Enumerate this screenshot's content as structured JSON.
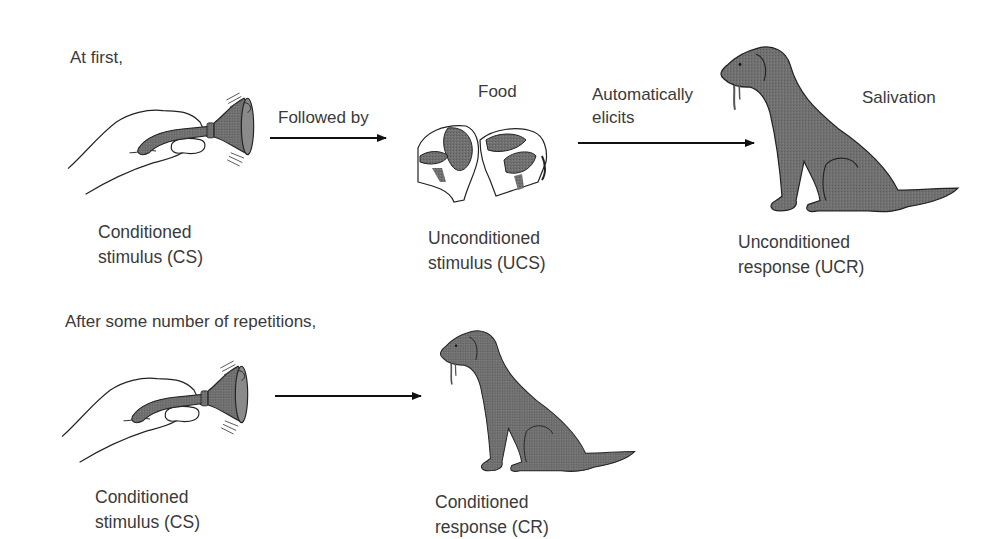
{
  "row1": {
    "intro": "At first,",
    "arrow1_label": "Followed by",
    "food_label": "Food",
    "arrow2_label_line1": "Automatically",
    "arrow2_label_line2": "elicits",
    "response_label": "Salivation",
    "cs": {
      "line1": "Conditioned",
      "line2": "stimulus (CS)"
    },
    "ucs": {
      "line1": "Unconditioned",
      "line2": "stimulus (UCS)"
    },
    "ucr": {
      "line1": "Unconditioned",
      "line2": "response (UCR)"
    }
  },
  "row2": {
    "intro": "After some number of repetitions,",
    "cs": {
      "line1": "Conditioned",
      "line2": "stimulus (CS)"
    },
    "cr": {
      "line1": "Conditioned",
      "line2": "response (CR)"
    }
  },
  "icons": {
    "bell": "hand-ringing-bell",
    "food": "meat-steak",
    "dog": "salivating-dog",
    "arrow": "right-arrow"
  },
  "colors": {
    "fill_gray": "#6e6e6e",
    "ink": "#222222",
    "text": "#3a3a3a",
    "background": "#ffffff"
  }
}
